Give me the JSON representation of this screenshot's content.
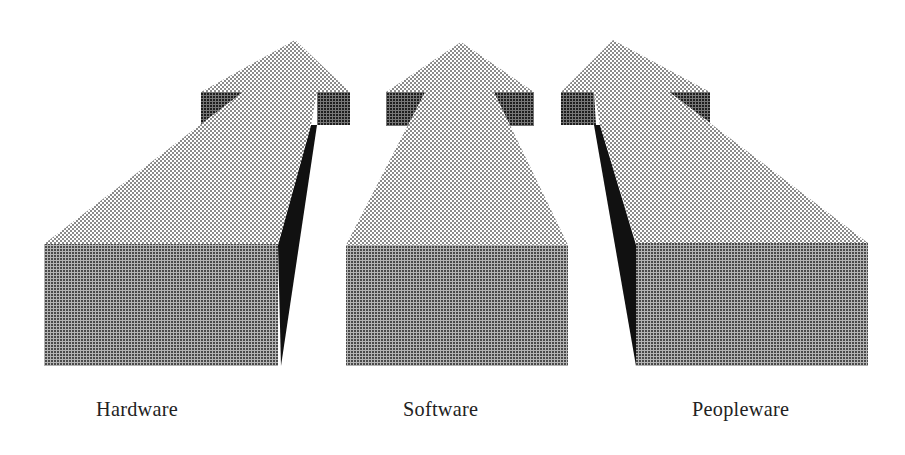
{
  "diagram": {
    "type": "three-arrows-3d",
    "colors": {
      "background": "#ffffff",
      "top_face": "#c8c8c8",
      "front_face": "#8c8c8c",
      "head_side_blocks": "#555555",
      "side_face": "#111111",
      "label_text": "#222222"
    },
    "arrows": [
      {
        "id": "hardware",
        "label": "Hardware",
        "direction": "up-right"
      },
      {
        "id": "software",
        "label": "Software",
        "direction": "up"
      },
      {
        "id": "peopleware",
        "label": "Peopleware",
        "direction": "up-left"
      }
    ]
  }
}
